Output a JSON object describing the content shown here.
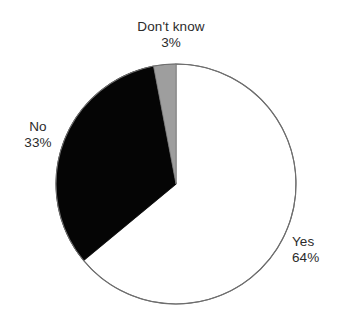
{
  "chart_data": {
    "type": "pie",
    "title": "",
    "subtitle": "",
    "xlabel": "",
    "ylabel": "",
    "legend_position": "none",
    "grid": false,
    "start_angle_deg": 0,
    "direction": "clockwise",
    "center": {
      "x": 176,
      "y": 184
    },
    "radius": 120,
    "categories": [
      "Yes",
      "No",
      "Don't know"
    ],
    "values": [
      64,
      33,
      3
    ],
    "value_unit": "%",
    "slices": [
      {
        "label": "Yes",
        "value": 64,
        "value_text": "64%",
        "fill": "#ffffff",
        "stroke": "#6e6e6e",
        "start_deg": 0,
        "end_deg": 230.4,
        "label_position": "right"
      },
      {
        "label": "No",
        "value": 33,
        "value_text": "33%",
        "fill": "#050505",
        "stroke": "#050505",
        "start_deg": 230.4,
        "end_deg": 349.2,
        "label_position": "left"
      },
      {
        "label": "Don't know",
        "value": 3,
        "value_text": "3%",
        "fill": "#9e9e9e",
        "stroke": "#7d7d7d",
        "start_deg": 349.2,
        "end_deg": 360,
        "label_position": "top"
      }
    ],
    "annotations": [
      {
        "text": "Don't know",
        "value_text": "3%"
      },
      {
        "text": "No",
        "value_text": "33%"
      },
      {
        "text": "Yes",
        "value_text": "64%"
      }
    ],
    "colors": {
      "background": "#ffffff",
      "outline": "#6e6e6e",
      "text": "#2b2b2b",
      "yes_fill": "#ffffff",
      "no_fill": "#050505",
      "dont_know_fill": "#9e9e9e"
    }
  }
}
